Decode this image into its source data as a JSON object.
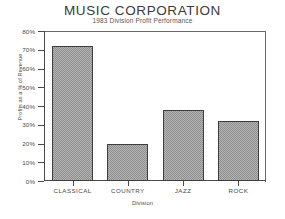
{
  "chart_data": {
    "type": "bar",
    "title": "MUSIC CORPORATION",
    "subtitle": "1983 Division Profit Performance",
    "xlabel": "Division",
    "ylabel": "Profits as a % of Revenue",
    "categories": [
      "CLASSICAL",
      "COUNTRY",
      "JAZZ",
      "ROCK"
    ],
    "values": [
      72,
      20,
      38,
      32
    ],
    "ylim": [
      0,
      80
    ],
    "ytick_values": [
      0,
      10,
      20,
      30,
      40,
      50,
      60,
      70,
      80
    ],
    "ytick_labels": [
      "0%",
      "10%",
      "20%",
      "30%",
      "40%",
      "50%",
      "60%",
      "70%",
      "80%"
    ],
    "grid": false,
    "legend": false,
    "bar_fill": "#b4b4b4",
    "bar_pattern": "checkerboard-dither",
    "bar_outline": "#3d3d3d",
    "background": "#ffffff",
    "axis_color": "#4a4a4a"
  }
}
